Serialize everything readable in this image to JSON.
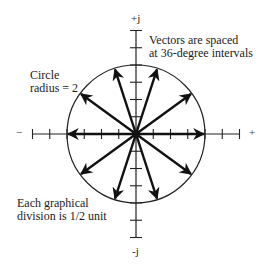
{
  "diagram": {
    "axis_labels": {
      "positive_imag": "+j",
      "negative_imag": "-j",
      "negative_real": "−",
      "positive_real": "+"
    },
    "annotations": {
      "vectors_line1": "Vectors are spaced",
      "vectors_line2": "at 36-degree intervals",
      "circle_line1": "Circle",
      "circle_line2": "radius = 2",
      "division_line1": "Each graphical",
      "division_line2": "division is 1/2 unit"
    },
    "geometry": {
      "circle_radius_units": 2,
      "division_units": 0.5,
      "vector_spacing_degrees": 36,
      "vector_count": 10,
      "vector_angles_degrees": [
        0,
        36,
        72,
        108,
        144,
        180,
        216,
        252,
        288,
        324
      ],
      "axis_ticks_each_side": 6
    },
    "colors": {
      "ink": "#111111",
      "background": "#ffffff"
    }
  }
}
